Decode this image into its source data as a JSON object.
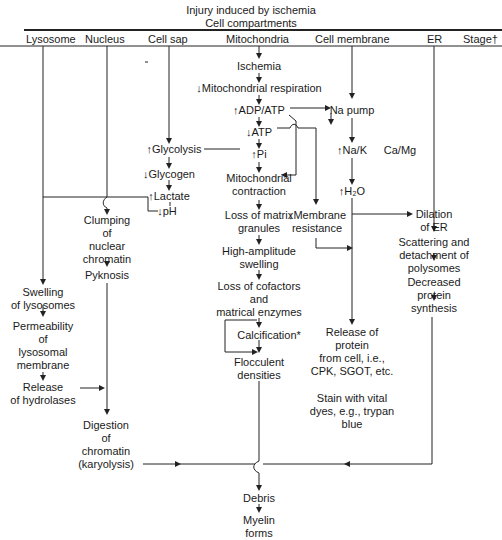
{
  "title": {
    "line1": "Injury induced by ischemia",
    "line2": "Cell compartments"
  },
  "columns": [
    {
      "label": "Lysosome"
    },
    {
      "label": "Nucleus"
    },
    {
      "label": "Cell sap"
    },
    {
      "label": "Mitochondria"
    },
    {
      "label": "Cell membrane"
    },
    {
      "label": "ER"
    },
    {
      "label": "Stage†"
    }
  ],
  "nodes": {
    "ischemia": "Ischemia",
    "mito_resp": "↓Mitochondrial respiration",
    "adp_atp": "↑ADP/ATP",
    "na_pump": "Na pump",
    "atp": "↓ATP",
    "pi": "↑Pi",
    "glycolysis": "↑Glycolysis",
    "na_k": "↑Na/K",
    "ca_mg": "Ca/Mg",
    "glycogen": "↓Glycogen",
    "mito_contraction": "Mitochondrial\ncontraction",
    "lactate": "↑Lactate",
    "h2o": "↑H₂O",
    "ph": "↓pH",
    "clumping": "Clumping\nof\nnuclear\nchromatin",
    "loss_matrix": "Loss of matrix\ngranules",
    "membrane_resistance": "↓Membrane\nresistance",
    "dilation_er": "Dilation\nof ER",
    "scattering": "Scattering and\ndetachment of\npolysomes",
    "pyknosis": "Pyknosis",
    "high_amplitude": "High-amplitude\nswelling",
    "decreased_protein": "Decreased\nprotein\nsynthesis",
    "swelling_lysosomes": "Swelling\nof lysosomes",
    "loss_cofactors": "Loss of cofactors\nand\nmatrical enzymes",
    "permeability": "Permeability\nof\nlysosomal\nmembrane",
    "calcification": "Calcification*",
    "release_protein": "Release of\nprotein\nfrom cell, i.e.,\nCPK, SGOT, etc.",
    "release_hydrolases": "Release\nof hydrolases",
    "flocculent": "Flocculent\ndensities",
    "stain": "Stain with vital\ndyes, e.g., trypan\nblue",
    "digestion": "Digestion\nof\nchromatin\n(karyolysis)",
    "debris": "Debris",
    "myelin": "Myelin\nforms"
  },
  "colors": {
    "ink": "#1a1a1a",
    "background": "#ffffff"
  }
}
